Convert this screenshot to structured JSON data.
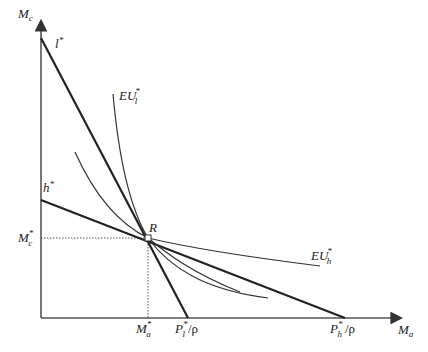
{
  "diagram": {
    "axes": {
      "y_label": {
        "base": "M",
        "sub": "c"
      },
      "x_label": {
        "base": "M",
        "sub": "a"
      }
    },
    "lines": [
      {
        "id": "l-star",
        "label": {
          "base": "l",
          "sup": "*"
        },
        "intercept_label": {
          "base": "P",
          "sup": "*",
          "sub": "l",
          "suffix": "/ρ"
        }
      },
      {
        "id": "h-star",
        "label": {
          "base": "h",
          "sup": "*"
        },
        "intercept_label": {
          "base": "P",
          "sup": "*",
          "sub": "h",
          "suffix": "/ρ"
        }
      }
    ],
    "curves": [
      {
        "id": "eu-l",
        "label": {
          "base": "EU",
          "sup": "*",
          "sub": "l"
        }
      },
      {
        "id": "eu-mid",
        "label": null
      },
      {
        "id": "eu-h",
        "label": {
          "base": "EU",
          "sup": "*",
          "sub": "h"
        }
      }
    ],
    "point": {
      "label": "R"
    },
    "guides": {
      "y_value_label": {
        "base": "M",
        "sup": "*",
        "sub": "c"
      },
      "x_value_label": {
        "base": "M",
        "sup": "*",
        "sub": "a"
      }
    }
  }
}
